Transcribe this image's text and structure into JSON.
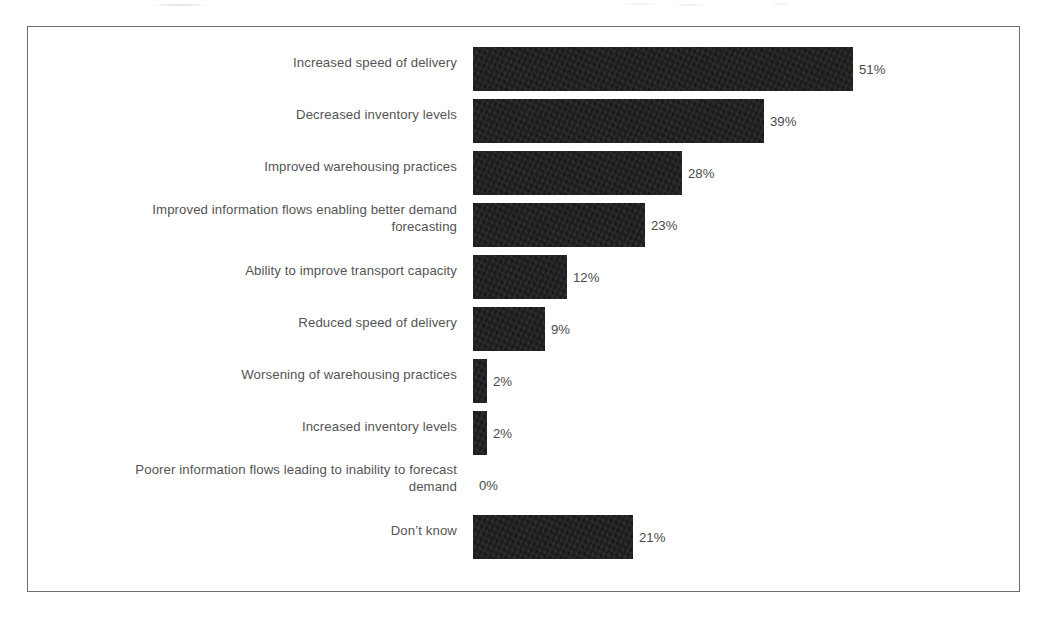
{
  "chart_data": {
    "type": "bar",
    "orientation": "horizontal",
    "title": "",
    "subtitle": "",
    "xlabel": "",
    "ylabel": "",
    "xlim": [
      0,
      55
    ],
    "grid": false,
    "legend": null,
    "value_suffix": "%",
    "bar_color": "#1b1b1b",
    "label_color": "#545454",
    "frame_color": "#6e6e6e",
    "background": "#ffffff",
    "categories": [
      "Increased speed of delivery",
      "Decreased inventory levels",
      "Improved warehousing practices",
      "Improved information flows enabling better demand\nforecasting",
      "Ability to improve transport capacity",
      "Reduced speed of delivery",
      "Worsening of warehousing practices",
      "Increased inventory levels",
      "Poorer information flows leading to inability to forecast\ndemand",
      "Don’t know"
    ],
    "values": [
      51,
      39,
      28,
      23,
      12,
      9,
      2,
      2,
      0,
      21
    ],
    "value_labels": [
      "51%",
      "39%",
      "28%",
      "23%",
      "12%",
      "9%",
      "2%",
      "2%",
      "0%",
      "21%"
    ]
  },
  "rows": [
    {
      "label": "Increased speed of delivery",
      "value": 51,
      "value_label": "51%",
      "top": 20,
      "label_top": 27,
      "bar_width": 380
    },
    {
      "label": "Decreased inventory levels",
      "value": 39,
      "value_label": "39%",
      "top": 72,
      "label_top": 79,
      "bar_width": 291
    },
    {
      "label": "Improved warehousing practices",
      "value": 28,
      "value_label": "28%",
      "top": 124,
      "label_top": 131,
      "bar_width": 209
    },
    {
      "label": "Improved information flows enabling better demand\nforecasting",
      "value": 23,
      "value_label": "23%",
      "top": 176,
      "label_top": 174,
      "bar_width": 172
    },
    {
      "label": "Ability to improve transport capacity",
      "value": 12,
      "value_label": "12%",
      "top": 228,
      "label_top": 235,
      "bar_width": 94
    },
    {
      "label": "Reduced speed of delivery",
      "value": 9,
      "value_label": "9%",
      "top": 280,
      "label_top": 287,
      "bar_width": 72
    },
    {
      "label": "Worsening of warehousing practices",
      "value": 2,
      "value_label": "2%",
      "top": 332,
      "label_top": 339,
      "bar_width": 14
    },
    {
      "label": "Increased inventory levels",
      "value": 2,
      "value_label": "2%",
      "top": 384,
      "label_top": 391,
      "bar_width": 14
    },
    {
      "label": "Poorer information flows leading to inability to forecast\ndemand",
      "value": 0,
      "value_label": "0%",
      "top": 436,
      "label_top": 434,
      "bar_width": 0
    },
    {
      "label": "Don’t know",
      "value": 21,
      "value_label": "21%",
      "top": 488,
      "label_top": 495,
      "bar_width": 160
    }
  ]
}
